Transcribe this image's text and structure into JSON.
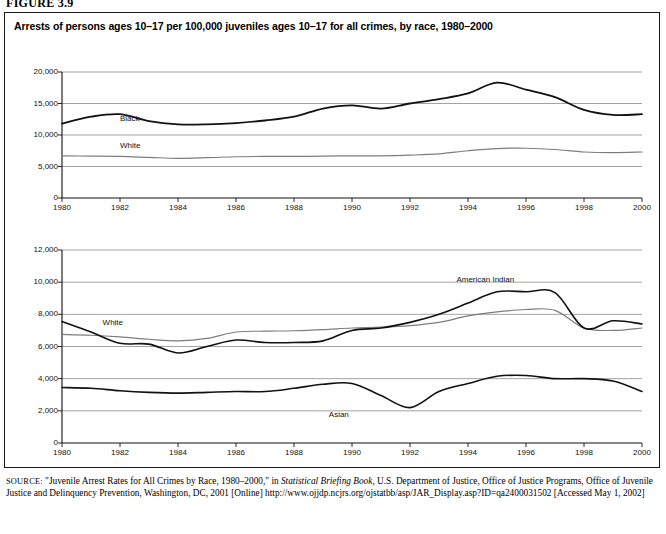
{
  "figure": {
    "number": "FIGURE 3.9",
    "title": "Arrests of persons ages 10–17 per 100,000 juveniles ages 10–17 for all crimes, by race, 1980–2000"
  },
  "source": {
    "keyword": "SOURCE:",
    "part1": " \"Juvenile Arrest Rates for All Crimes by Race, 1980–2000,\" in ",
    "italic": "Statistical Briefing Book",
    "part2": ", U.S. Department of Justice, Office of Justice Programs, Office of Juvenile Justice and Delinquency Prevention, Washington, DC, 2001 [Online] http://www.ojjdp.ncjrs.org/ojstatbb/asp/JAR_Display.asp?ID=qa2400031502 [Accessed May 1, 2002]"
  },
  "colors": {
    "dark_line": "#111111",
    "light_line": "#7d7d7d",
    "grid": "#8c8c8c",
    "axis": "#111111",
    "background": "#ffffff"
  },
  "chart_data": [
    {
      "type": "line",
      "id": "chart-black-white",
      "title": "",
      "xlabel": "",
      "ylabel": "",
      "xlim": [
        1980,
        2000
      ],
      "ylim": [
        0,
        20000
      ],
      "ytick_labels": [
        "0",
        "5,000",
        "10,000",
        "15,000",
        "20,000"
      ],
      "yticks": [
        0,
        5000,
        10000,
        15000,
        20000
      ],
      "xtick_labels": [
        "1980",
        "1982",
        "1984",
        "1986",
        "1988",
        "1990",
        "1992",
        "1994",
        "1996",
        "1998",
        "2000"
      ],
      "xticks": [
        1980,
        1982,
        1984,
        1986,
        1988,
        1990,
        1992,
        1994,
        1996,
        1998,
        2000
      ],
      "grid": true,
      "legend": "inline-labels",
      "x": [
        1980,
        1981,
        1982,
        1983,
        1984,
        1985,
        1986,
        1987,
        1988,
        1989,
        1990,
        1991,
        1992,
        1993,
        1994,
        1995,
        1996,
        1997,
        1998,
        1999,
        2000
      ],
      "series": [
        {
          "name": "Black",
          "color": "#111111",
          "width": 1.8,
          "label_x": 1982.0,
          "label_y": 12600,
          "values": [
            11800,
            12900,
            13300,
            12200,
            11700,
            11700,
            11900,
            12300,
            12900,
            14200,
            14700,
            14200,
            15000,
            15700,
            16600,
            18300,
            17200,
            16000,
            14000,
            13200,
            13300
          ]
        },
        {
          "name": "White",
          "color": "#7d7d7d",
          "width": 1.2,
          "label_x": 1982.0,
          "label_y": 8200,
          "values": [
            6700,
            6650,
            6600,
            6450,
            6300,
            6400,
            6550,
            6600,
            6600,
            6650,
            6700,
            6700,
            6800,
            7000,
            7500,
            7850,
            7900,
            7700,
            7300,
            7200,
            7300
          ]
        }
      ]
    },
    {
      "type": "line",
      "id": "chart-white-amind-asian",
      "title": "",
      "xlabel": "",
      "ylabel": "",
      "xlim": [
        1980,
        2000
      ],
      "ylim": [
        0,
        12000
      ],
      "ytick_labels": [
        "0",
        "2,000",
        "4,000",
        "6,000",
        "8,000",
        "10,000",
        "12,000"
      ],
      "yticks": [
        0,
        2000,
        4000,
        6000,
        8000,
        10000,
        12000
      ],
      "xtick_labels": [
        "1980",
        "1982",
        "1984",
        "1986",
        "1988",
        "1990",
        "1992",
        "1994",
        "1996",
        "1998",
        "2000"
      ],
      "xticks": [
        1980,
        1982,
        1984,
        1986,
        1988,
        1990,
        1992,
        1994,
        1996,
        1998,
        2000
      ],
      "grid": true,
      "legend": "inline-labels",
      "x": [
        1980,
        1981,
        1982,
        1983,
        1984,
        1985,
        1986,
        1987,
        1988,
        1989,
        1990,
        1991,
        1992,
        1993,
        1994,
        1995,
        1996,
        1997,
        1998,
        1999,
        2000
      ],
      "series": [
        {
          "name": "White",
          "color": "#7d7d7d",
          "width": 1.2,
          "label_x": 1981.4,
          "label_y": 7450,
          "values": [
            6750,
            6700,
            6600,
            6450,
            6350,
            6500,
            6900,
            6950,
            6980,
            7050,
            7150,
            7200,
            7300,
            7500,
            7900,
            8150,
            8300,
            8250,
            7150,
            7000,
            7150
          ]
        },
        {
          "name": "American Indian",
          "color": "#111111",
          "width": 1.6,
          "label_x": 1993.6,
          "label_y": 10150,
          "values": [
            7550,
            6900,
            6200,
            6150,
            5600,
            6000,
            6400,
            6250,
            6250,
            6350,
            7000,
            7150,
            7500,
            8000,
            8700,
            9400,
            9400,
            9350,
            7150,
            7600,
            7400
          ]
        },
        {
          "name": "Asian",
          "color": "#111111",
          "width": 1.6,
          "label_x": 1989.2,
          "label_y": 1720,
          "values": [
            3450,
            3400,
            3250,
            3150,
            3100,
            3150,
            3200,
            3200,
            3400,
            3650,
            3700,
            2950,
            2200,
            3200,
            3700,
            4150,
            4200,
            4000,
            4000,
            3850,
            3200
          ]
        }
      ]
    }
  ]
}
